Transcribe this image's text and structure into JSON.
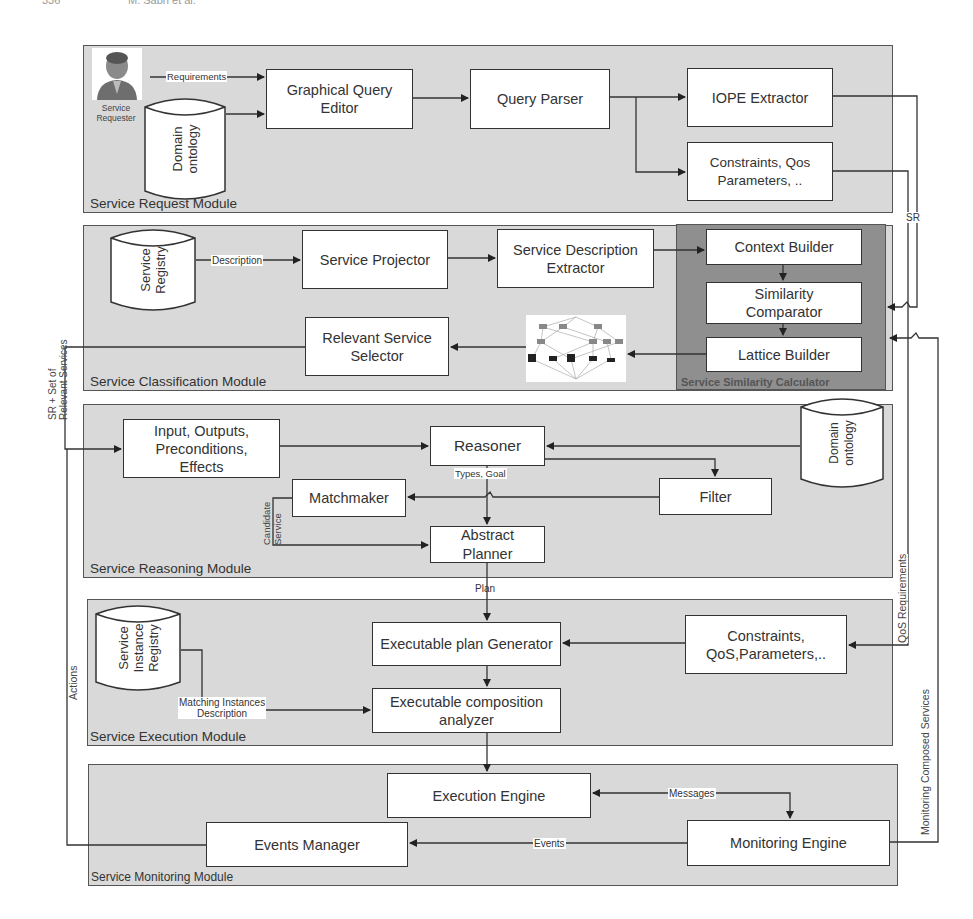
{
  "page_header": {
    "left": "336",
    "right": "M. Sabri et al."
  },
  "modules": {
    "request": {
      "label": "Service Request Module"
    },
    "classification": {
      "label": "Service Classification Module"
    },
    "similarity_calculator": {
      "label": "Service Similarity Calculator"
    },
    "reasoning": {
      "label": "Service Reasoning Module"
    },
    "execution": {
      "label": "Service Execution Module"
    },
    "monitoring": {
      "label": "Service Monitoring Module"
    }
  },
  "actors": {
    "service_requester": {
      "label": "Service\nRequester"
    }
  },
  "datastores": {
    "domain_ontology_request": {
      "label": "Domain\nontology"
    },
    "service_registry": {
      "label": "Service\nRegistry"
    },
    "domain_ontology_reasoning": {
      "label": "Domain\nontology"
    },
    "service_instance_registry": {
      "label": "Service\nInstance\nRegistry"
    }
  },
  "boxes": {
    "graphical_query_editor": "Graphical Query\nEditor",
    "query_parser": "Query Parser",
    "iope_extractor": "IOPE Extractor",
    "constraints_qos_request": "Constraints, Qos\nParameters, ..",
    "service_projector": "Service Projector",
    "service_description_extractor": "Service Description\nExtractor",
    "context_builder": "Context Builder",
    "similarity_comparator": "Similarity\nComparator",
    "lattice_builder": "Lattice Builder",
    "relevant_service_selector": "Relevant Service\nSelector",
    "iope": "Input, Outputs,\nPreconditions,\nEffects",
    "reasoner": "Reasoner",
    "filter": "Filter",
    "matchmaker": "Matchmaker",
    "abstract_planner": "Abstract\nPlanner",
    "executable_plan_generator": "Executable plan Generator",
    "constraints_qos_execution": "Constraints,\nQoS,Parameters,..",
    "executable_composition_analyzer": "Executable composition\nanalyzer",
    "execution_engine": "Execution Engine",
    "monitoring_engine": "Monitoring Engine",
    "events_manager": "Events Manager"
  },
  "edge_labels": {
    "requirements": "Requirements",
    "description": "Description",
    "sr": "SR",
    "sr_set_relevant": "SR + Set of\nRelevant Services",
    "types_goal": "Types, Goal",
    "candidate_service": "Candidate\nService",
    "plan": "Plan",
    "qos_requirements": "QoS Requirements",
    "matching_instances": "Matching Instances\nDescription",
    "actions": "Actions",
    "monitoring_composed": "Monitoring Composed Services",
    "messages": "Messages",
    "events": "Events"
  },
  "colors": {
    "module_fill": "#d9d9d9",
    "calculator_fill": "#8f8f8f",
    "box_fill": "#ffffff",
    "stroke": "#333333"
  }
}
